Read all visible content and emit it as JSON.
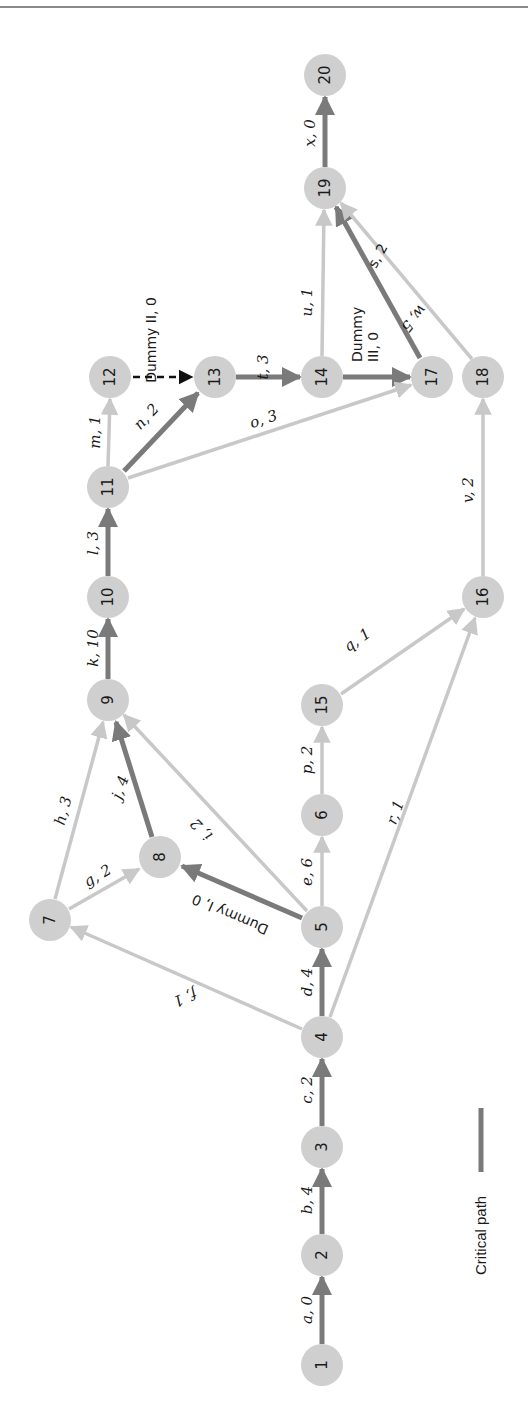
{
  "figure": {
    "orientation": "rotated-90-ccw",
    "colors": {
      "critical": "#7a7a7a",
      "noncritical": "#c8c8c8",
      "dummy": "#111111",
      "node_fill": "#cfcfcf"
    }
  },
  "nodes": [
    {
      "id": "1",
      "x": 322,
      "y": 1365
    },
    {
      "id": "2",
      "x": 322,
      "y": 1255
    },
    {
      "id": "3",
      "x": 322,
      "y": 1147
    },
    {
      "id": "4",
      "x": 322,
      "y": 1037
    },
    {
      "id": "5",
      "x": 322,
      "y": 927
    },
    {
      "id": "6",
      "x": 322,
      "y": 815
    },
    {
      "id": "7",
      "x": 50,
      "y": 920
    },
    {
      "id": "8",
      "x": 160,
      "y": 857
    },
    {
      "id": "9",
      "x": 108,
      "y": 700
    },
    {
      "id": "10",
      "x": 108,
      "y": 597
    },
    {
      "id": "11",
      "x": 108,
      "y": 487
    },
    {
      "id": "12",
      "x": 110,
      "y": 377
    },
    {
      "id": "13",
      "x": 215,
      "y": 377
    },
    {
      "id": "14",
      "x": 322,
      "y": 377
    },
    {
      "id": "15",
      "x": 322,
      "y": 705
    },
    {
      "id": "16",
      "x": 483,
      "y": 597
    },
    {
      "id": "17",
      "x": 432,
      "y": 377
    },
    {
      "id": "18",
      "x": 483,
      "y": 377
    },
    {
      "id": "19",
      "x": 325,
      "y": 188
    },
    {
      "id": "20",
      "x": 325,
      "y": 75
    }
  ],
  "activities": [
    {
      "from": "1",
      "to": "2",
      "label": "a, 0",
      "critical": true
    },
    {
      "from": "2",
      "to": "3",
      "label": "b, 4",
      "critical": true
    },
    {
      "from": "3",
      "to": "4",
      "label": "c, 2",
      "critical": true
    },
    {
      "from": "4",
      "to": "5",
      "label": "d, 4",
      "critical": true
    },
    {
      "from": "5",
      "to": "6",
      "label": "e, 6",
      "critical": false
    },
    {
      "from": "4",
      "to": "7",
      "label": "f, 1",
      "critical": false
    },
    {
      "from": "7",
      "to": "8",
      "label": "g, 2",
      "critical": false
    },
    {
      "from": "7",
      "to": "9",
      "label": "h, 3",
      "critical": false
    },
    {
      "from": "5",
      "to": "9",
      "label": "i, 2",
      "critical": false
    },
    {
      "from": "8",
      "to": "9",
      "label": "j, 4",
      "critical": true
    },
    {
      "from": "9",
      "to": "10",
      "label": "k, 10",
      "critical": true
    },
    {
      "from": "10",
      "to": "11",
      "label": "l, 3",
      "critical": true
    },
    {
      "from": "11",
      "to": "12",
      "label": "m, 1",
      "critical": false
    },
    {
      "from": "11",
      "to": "13",
      "label": "n, 2",
      "critical": true
    },
    {
      "from": "11",
      "to": "17",
      "label": "o, 3",
      "critical": false
    },
    {
      "from": "6",
      "to": "15",
      "label": "p, 2",
      "critical": false
    },
    {
      "from": "15",
      "to": "16",
      "label": "q, 1",
      "critical": false
    },
    {
      "from": "4",
      "to": "16",
      "label": "r, 1",
      "critical": false
    },
    {
      "from": "17",
      "to": "19",
      "label": "s, 2",
      "critical": true
    },
    {
      "from": "13",
      "to": "14",
      "label": "t, 3",
      "critical": true
    },
    {
      "from": "14",
      "to": "19",
      "label": "u, 1",
      "critical": false
    },
    {
      "from": "16",
      "to": "18",
      "label": "v, 2",
      "critical": false
    },
    {
      "from": "18",
      "to": "19",
      "label": "w, 5",
      "critical": false
    },
    {
      "from": "19",
      "to": "20",
      "label": "x, 0",
      "critical": true
    },
    {
      "from": "5",
      "to": "8",
      "label": "Dummy I, 0",
      "critical": true,
      "dummy": true
    },
    {
      "from": "12",
      "to": "13",
      "label": "Dummy II, 0",
      "critical": false,
      "dummy": true
    },
    {
      "from": "14",
      "to": "17",
      "label": "Dummy III, 0",
      "critical": true,
      "dummy": true
    }
  ],
  "labels": {
    "a": "a, 0",
    "b": "b, 4",
    "c": "c, 2",
    "d": "d, 4",
    "e": "e, 6",
    "f": "f, 1",
    "g": "g, 2",
    "h": "h, 3",
    "i": "i, 2",
    "j": "j, 4",
    "k": "k, 10",
    "l": "l, 3",
    "m": "m, 1",
    "n": "n, 2",
    "o": "o, 3",
    "p": "p, 2",
    "q": "q, 1",
    "r": "r, 1",
    "s": "s, 2",
    "t": "t, 3",
    "u": "u, 1",
    "v": "v, 2",
    "w": "w, 5",
    "x": "x, 0",
    "dummy1": "Dummy I, 0",
    "dummy2": "Dummy II, 0",
    "dummy3_line1": "Dummy",
    "dummy3_line2": "III, 0"
  },
  "legend": {
    "label": "Critical path"
  }
}
